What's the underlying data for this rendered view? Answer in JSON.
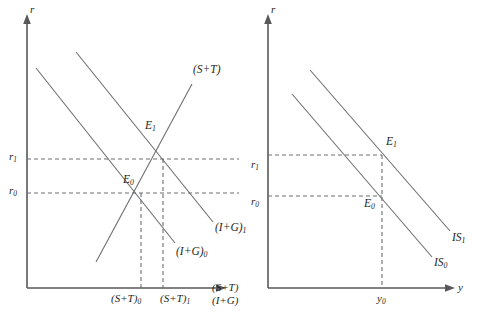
{
  "figure": {
    "type": "diagram",
    "background_color": "#ffffff",
    "line_color": "#6d6e70",
    "axis_color": "#58585a",
    "text_color": "#231f20"
  },
  "left_panel": {
    "y_axis_label": "r",
    "x_axis_label_line1": "(S+T)",
    "x_axis_label_line2": "(I+G)",
    "y_ticks": [
      {
        "label": "r",
        "sub": "1"
      },
      {
        "label": "r",
        "sub": "0"
      }
    ],
    "x_ticks": [
      {
        "label": "(S+T)",
        "sub": "0"
      },
      {
        "label": "(S+T)",
        "sub": "1"
      }
    ],
    "equilibria": [
      {
        "label": "E",
        "sub": "1"
      },
      {
        "label": "E",
        "sub": "0"
      }
    ],
    "curves": [
      {
        "name": "(S+T)",
        "sub": "",
        "slope": "upward"
      },
      {
        "name": "(I+G)",
        "sub": "1",
        "slope": "downward"
      },
      {
        "name": "(I+G)",
        "sub": "0",
        "slope": "downward"
      }
    ]
  },
  "right_panel": {
    "y_axis_label": "r",
    "x_axis_label": "y",
    "y_ticks": [
      {
        "label": "r",
        "sub": "1"
      },
      {
        "label": "r",
        "sub": "0"
      }
    ],
    "x_ticks": [
      {
        "label": "y",
        "sub": "0"
      }
    ],
    "equilibria": [
      {
        "label": "E",
        "sub": "1"
      },
      {
        "label": "E",
        "sub": "0"
      }
    ],
    "curves": [
      {
        "name": "IS",
        "sub": "1",
        "slope": "downward"
      },
      {
        "name": "IS",
        "sub": "0",
        "slope": "downward"
      }
    ]
  }
}
